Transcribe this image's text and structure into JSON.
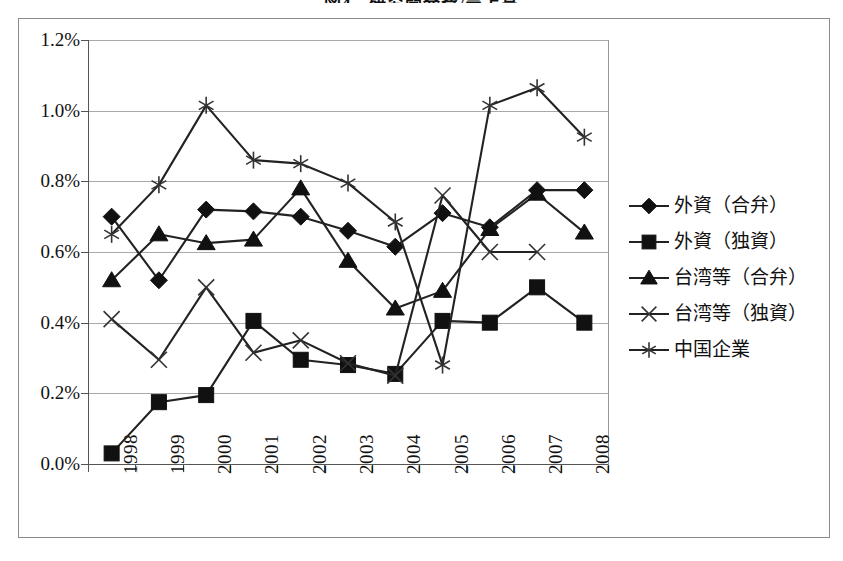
{
  "title": "図4　研究開発費/売上高",
  "axes": {
    "y_ticks": [
      "1.2%",
      "1.0%",
      "0.8%",
      "0.6%",
      "0.4%",
      "0.2%",
      "0.0%"
    ],
    "x_ticks": [
      "1998",
      "1999",
      "2000",
      "2001",
      "2002",
      "2003",
      "2004",
      "2005",
      "2006",
      "2007",
      "2008"
    ]
  },
  "legend": {
    "items": [
      {
        "label": "外資（合弁）",
        "marker": "diamond"
      },
      {
        "label": "外資（独資）",
        "marker": "square"
      },
      {
        "label": "台湾等（合弁）",
        "marker": "triangle"
      },
      {
        "label": "台湾等（独資）",
        "marker": "x"
      },
      {
        "label": "中国企業",
        "marker": "asterisk"
      }
    ]
  },
  "chart_data": {
    "type": "line",
    "title": "図4　研究開発費/売上高",
    "xlabel": "",
    "ylabel": "",
    "ylim": [
      0.0,
      1.2
    ],
    "yticks": [
      0.0,
      0.2,
      0.4,
      0.6,
      0.8,
      1.0,
      1.2
    ],
    "ytick_labels": [
      "0.0%",
      "0.2%",
      "0.4%",
      "0.6%",
      "0.8%",
      "1.0%",
      "1.2%"
    ],
    "grid": true,
    "legend_position": "right",
    "units": "percent",
    "categories": [
      "1998",
      "1999",
      "2000",
      "2001",
      "2002",
      "2003",
      "2004",
      "2005",
      "2006",
      "2007",
      "2008"
    ],
    "series": [
      {
        "name": "外資（合弁）",
        "marker": "diamond",
        "values": [
          0.7,
          0.52,
          0.72,
          0.715,
          0.7,
          0.66,
          0.615,
          0.71,
          0.67,
          0.775,
          0.775
        ]
      },
      {
        "name": "外資（独資）",
        "marker": "square",
        "values": [
          0.03,
          0.175,
          0.195,
          0.405,
          0.295,
          0.28,
          0.255,
          0.405,
          0.4,
          0.5,
          0.4
        ]
      },
      {
        "name": "台湾等（合弁）",
        "marker": "triangle",
        "values": [
          0.52,
          0.65,
          0.625,
          0.635,
          0.78,
          0.575,
          0.44,
          0.49,
          0.665,
          0.765,
          0.655
        ]
      },
      {
        "name": "台湾等（独資）",
        "marker": "x",
        "values": [
          0.41,
          0.295,
          0.5,
          0.315,
          0.35,
          0.285,
          0.25,
          0.76,
          0.6,
          0.6,
          null
        ]
      },
      {
        "name": "中国企業",
        "marker": "asterisk",
        "values": [
          0.65,
          0.79,
          1.015,
          0.86,
          0.85,
          0.795,
          0.685,
          0.28,
          1.015,
          1.065,
          0.925
        ]
      }
    ]
  }
}
